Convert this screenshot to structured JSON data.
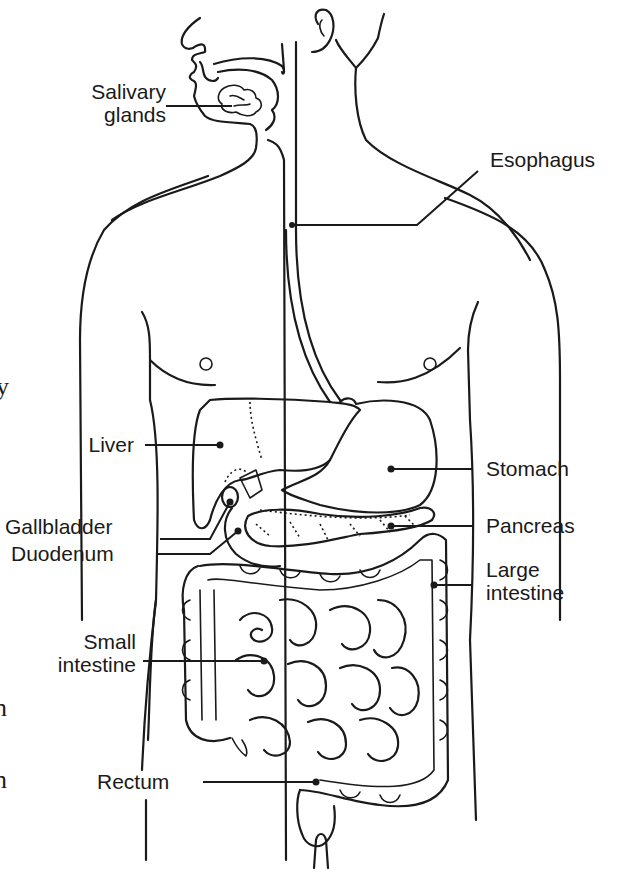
{
  "diagram": {
    "labels": {
      "salivary_glands": [
        "Salivary",
        "glands"
      ],
      "esophagus": "Esophagus",
      "liver": "Liver",
      "stomach": "Stomach",
      "gallbladder": "Gallbladder",
      "duodenum": "Duodenum",
      "pancreas": "Pancreas",
      "large_intestine": [
        "Large",
        "intestine"
      ],
      "small_intestine": [
        "Small",
        "intestine"
      ],
      "rectum": "Rectum"
    },
    "edge_fragments": {
      "left_top": "y",
      "left_mid": "n",
      "left_low": "n"
    },
    "colors": {
      "ink": "#1a1a1a",
      "background": "#ffffff"
    }
  }
}
